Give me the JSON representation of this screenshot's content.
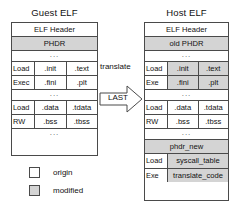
{
  "guest": {
    "title": "Guest ELF",
    "rows": [
      {
        "kind": "single",
        "label": "ELF Header",
        "shaded": false
      },
      {
        "kind": "single",
        "label": "PHDR",
        "shaded": true
      },
      {
        "kind": "ellipsis",
        "label": "...",
        "shaded": false
      },
      {
        "kind": "band",
        "seg_labels": [
          "Load",
          "Exec"
        ],
        "cols": [
          {
            "top": ".init",
            "bottom": ".fini",
            "shaded": false
          },
          {
            "top": ".text",
            "bottom": ".plt",
            "shaded": false
          }
        ]
      },
      {
        "kind": "ellipsis",
        "label": "...",
        "shaded": false
      },
      {
        "kind": "band",
        "seg_labels": [
          "Load",
          "RW"
        ],
        "cols": [
          {
            "top": ".data",
            "bottom": ".bss",
            "shaded": false
          },
          {
            "top": ".tdata",
            "bottom": ".tbss",
            "shaded": false
          }
        ]
      },
      {
        "kind": "ellipsis",
        "label": "...",
        "shaded": false
      }
    ]
  },
  "host": {
    "title": "Host ELF",
    "rows": [
      {
        "kind": "single",
        "label": "ELF Header",
        "shaded": false
      },
      {
        "kind": "single",
        "label": "old PHDR",
        "shaded": true
      },
      {
        "kind": "ellipsis",
        "label": "...",
        "shaded": false
      },
      {
        "kind": "band",
        "seg_labels": [
          "Load",
          "Exe"
        ],
        "cols": [
          {
            "top": ".init",
            "bottom": ".fini",
            "shaded": true
          },
          {
            "top": ".text",
            "bottom": ".plt",
            "shaded": true
          }
        ]
      },
      {
        "kind": "ellipsis",
        "label": "...",
        "shaded": false
      },
      {
        "kind": "band",
        "seg_labels": [
          "Load",
          "RW"
        ],
        "cols": [
          {
            "top": ".data",
            "bottom": ".bss",
            "shaded": false
          },
          {
            "top": ".tdata",
            "bottom": ".tbss",
            "shaded": false
          }
        ]
      },
      {
        "kind": "ellipsis",
        "label": "...",
        "shaded": false
      },
      {
        "kind": "single",
        "label": "phdr_new",
        "shaded": true
      },
      {
        "kind": "band-wide",
        "seg_labels": [
          "Load",
          "Exe"
        ],
        "cols": [
          {
            "top": "syscall_table",
            "bottom": "translate_code",
            "shaded": true
          }
        ]
      }
    ]
  },
  "arrow": {
    "translate_label": "translate",
    "last_label": "LAST",
    "icon": "right-arrow-icon"
  },
  "legend": {
    "items": [
      {
        "label": "origin",
        "shaded": false
      },
      {
        "label": "modified",
        "shaded": true
      }
    ]
  },
  "colors": {
    "shaded_fill": "#d4d4d4",
    "white_fill": "#ffffff",
    "stroke": "#4a4a4a",
    "text": "#111111"
  }
}
